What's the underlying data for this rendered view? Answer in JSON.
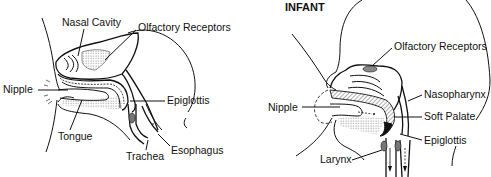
{
  "diagram": {
    "panels": [
      {
        "id": "adult",
        "title": "",
        "labels": {
          "nasal_cavity": "Nasal Cavity",
          "olfactory_receptors": "Olfactory Receptors",
          "nipple": "Nipple",
          "epiglottis": "Epiglottis",
          "tongue": "Tongue",
          "trachea": "Trachea",
          "esophagus": "Esophagus"
        }
      },
      {
        "id": "infant",
        "title": "INFANT",
        "labels": {
          "olfactory_receptors": "Olfactory Receptors",
          "nipple": "Nipple",
          "nasopharynx": "Nasopharynx",
          "soft_palate": "Soft Palate",
          "epiglottis": "Epiglottis",
          "larynx": "Larynx"
        }
      }
    ],
    "colors": {
      "line": "#111111",
      "background": "#ffffff",
      "shade": "#9a9a9a"
    }
  }
}
